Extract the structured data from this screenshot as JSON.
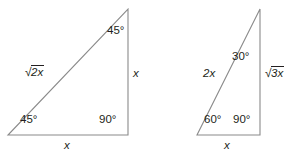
{
  "figure": {
    "line_color": "#8a8a8a",
    "text_color": "#231f20",
    "background": "#ffffff"
  },
  "triangles": [
    {
      "name": "triangle-45-45-90",
      "type": "45-45-90 right triangle",
      "vertices": {
        "bottom_left": [
          8,
          135
        ],
        "bottom_right": [
          128,
          135
        ],
        "top_right": [
          128,
          9
        ]
      },
      "angles": [
        {
          "name": "angle-top-right",
          "value": "45°"
        },
        {
          "name": "angle-bottom-left",
          "value": "45°"
        },
        {
          "name": "angle-bottom-right",
          "value": "90°"
        }
      ],
      "sides": {
        "hypotenuse": {
          "sign": "√",
          "radicand": "2x"
        },
        "vertical": "x",
        "base": "x"
      }
    },
    {
      "name": "triangle-30-60-90",
      "type": "30-60-90 right triangle",
      "vertices": {
        "bottom_left": [
          197,
          135
        ],
        "bottom_right": [
          260,
          135
        ],
        "top_right": [
          260,
          9
        ]
      },
      "angles": [
        {
          "name": "angle-top-right",
          "value": "30°"
        },
        {
          "name": "angle-bottom-left",
          "value": "60°"
        },
        {
          "name": "angle-bottom-right",
          "value": "90°"
        }
      ],
      "sides": {
        "hypotenuse": "2x",
        "vertical": {
          "sign": "√",
          "radicand": "3x"
        },
        "base": "x"
      }
    }
  ]
}
